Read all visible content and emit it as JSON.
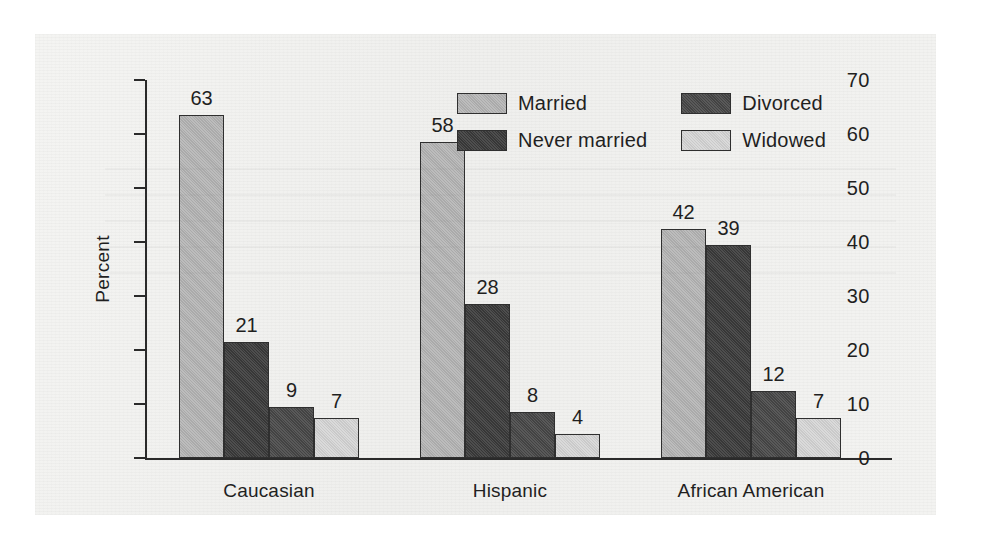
{
  "chart_data": {
    "type": "bar",
    "title": "",
    "xlabel": "",
    "ylabel": "Percent",
    "ylim": [
      0,
      70
    ],
    "yticks": [
      0,
      10,
      20,
      30,
      40,
      50,
      60,
      70
    ],
    "grid": false,
    "legend_position": "top-right inside plot",
    "categories": [
      "Caucasian",
      "Hispanic",
      "African American"
    ],
    "series": [
      {
        "name": "Married",
        "values": [
          63,
          58,
          42
        ],
        "color": "#b5b5b5"
      },
      {
        "name": "Never married",
        "values": [
          21,
          28,
          39
        ],
        "color": "#3a3a3a"
      },
      {
        "name": "Divorced",
        "values": [
          9,
          8,
          12
        ],
        "color": "#474747"
      },
      {
        "name": "Widowed",
        "values": [
          7,
          4,
          7
        ],
        "color": "#d6d6d6"
      }
    ],
    "data_labels": [
      [
        "63",
        "21",
        "9",
        "7"
      ],
      [
        "58",
        "28",
        "8",
        "4"
      ],
      [
        "42",
        "39",
        "12",
        "7"
      ]
    ],
    "tick_labels": [
      "0",
      "10",
      "20",
      "30",
      "40",
      "50",
      "60",
      "70"
    ],
    "legend_order": [
      "Married",
      "Divorced",
      "Never married",
      "Widowed"
    ]
  },
  "colors": {
    "paper": "#f2f2f0",
    "axis": "#2a2a2a",
    "text": "#1f1f1f",
    "bar_outline": "#2f2f2f",
    "married": "#b5b5b5",
    "never_married": "#3a3a3a",
    "divorced": "#474747",
    "widowed": "#d6d6d6"
  }
}
